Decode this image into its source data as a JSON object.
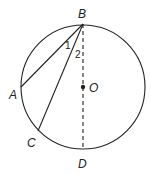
{
  "diagram": {
    "points": {
      "B": {
        "label": "B"
      },
      "A": {
        "label": "A"
      },
      "C": {
        "label": "C"
      },
      "D": {
        "label": "D"
      },
      "O": {
        "label": "O"
      }
    },
    "angles": {
      "angle1": {
        "label": "1"
      },
      "angle2": {
        "label": "2"
      }
    },
    "colors": {
      "stroke": "#222222",
      "background": "#ffffff"
    }
  }
}
